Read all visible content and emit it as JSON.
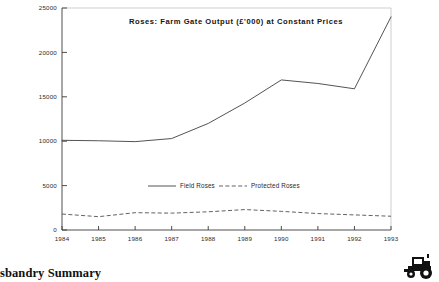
{
  "chart_data": {
    "type": "line",
    "title": "Roses:  Farm  Gate  Output  (£'000)  at  Constant  Prices",
    "xlabel": "",
    "ylabel": "",
    "x": [
      1984,
      1985,
      1986,
      1987,
      1988,
      1989,
      1990,
      1991,
      1992,
      1993
    ],
    "categories": [
      "1984",
      "1985",
      "1986",
      "1987",
      "1988",
      "1989",
      "1990",
      "1991",
      "1992",
      "1993"
    ],
    "series": [
      {
        "name": "Field Roses",
        "style": "solid",
        "color": "#4a4a4a",
        "values": [
          10100,
          10050,
          9950,
          10300,
          12000,
          14300,
          16900,
          16500,
          15900,
          24000
        ]
      },
      {
        "name": "Protected Roses",
        "style": "dashed",
        "color": "#5a5a5a",
        "values": [
          1800,
          1500,
          1950,
          1900,
          2050,
          2300,
          2100,
          1850,
          1700,
          1550
        ]
      }
    ],
    "ylim": [
      0,
      25000
    ],
    "yticks": [
      0,
      5000,
      10000,
      15000,
      20000,
      25000
    ],
    "ytick_labels": [
      "0",
      "5000",
      "10000",
      "15000",
      "20000",
      "25000"
    ],
    "xlim": [
      1984,
      1993
    ],
    "grid": false,
    "legend_position": "inside-center",
    "legend": [
      "Field Roses",
      "Protected Roses"
    ]
  },
  "footer": {
    "caption": "sbandry Summary",
    "logo_name": "tractor-logo"
  }
}
